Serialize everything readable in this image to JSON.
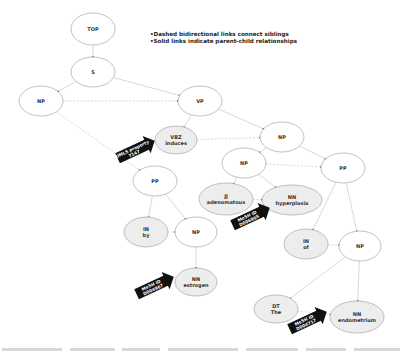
{
  "legend": {
    "line1": "•Dashed bidirectional links connect siblings",
    "line2": "•Solid links indicate parent-child relationships"
  },
  "nodes": [
    {
      "id": "top",
      "tag": "TOP",
      "word": "",
      "cx": 93,
      "cy": 29,
      "rx": 22,
      "ry": 16,
      "shaded": false
    },
    {
      "id": "s",
      "tag": "S",
      "word": "",
      "cx": 93,
      "cy": 72,
      "rx": 22,
      "ry": 15,
      "shaded": false
    },
    {
      "id": "np1",
      "tag": "NP",
      "word": "",
      "cx": 41,
      "cy": 101,
      "rx": 22,
      "ry": 15,
      "shaded": false
    },
    {
      "id": "vp",
      "tag": "VP",
      "word": "",
      "cx": 200,
      "cy": 101,
      "rx": 22,
      "ry": 15,
      "shaded": false
    },
    {
      "id": "vbz",
      "tag": "VBZ",
      "word": "induces",
      "cx": 176,
      "cy": 140,
      "rx": 21,
      "ry": 14,
      "shaded": true
    },
    {
      "id": "np2",
      "tag": "NP",
      "word": "",
      "cx": 282,
      "cy": 137,
      "rx": 22,
      "ry": 15,
      "shaded": false
    },
    {
      "id": "pp1",
      "tag": "PP",
      "word": "",
      "cx": 155,
      "cy": 181,
      "rx": 22,
      "ry": 15,
      "shaded": false
    },
    {
      "id": "np3",
      "tag": "NP",
      "word": "",
      "cx": 244,
      "cy": 163,
      "rx": 22,
      "ry": 15,
      "shaded": false
    },
    {
      "id": "pp2",
      "tag": "PP",
      "word": "",
      "cx": 343,
      "cy": 168,
      "rx": 22,
      "ry": 15,
      "shaded": false
    },
    {
      "id": "jj",
      "tag": "JJ",
      "word": "adenomatous",
      "cx": 226,
      "cy": 199,
      "rx": 27,
      "ry": 16,
      "shaded": true
    },
    {
      "id": "nn1",
      "tag": "NN",
      "word": "hyperplasia",
      "cx": 292,
      "cy": 200,
      "rx": 30,
      "ry": 15,
      "shaded": true
    },
    {
      "id": "in1",
      "tag": "IN",
      "word": "by",
      "cx": 146,
      "cy": 232,
      "rx": 22,
      "ry": 15,
      "shaded": true
    },
    {
      "id": "np4",
      "tag": "NP",
      "word": "",
      "cx": 196,
      "cy": 232,
      "rx": 21,
      "ry": 15,
      "shaded": false
    },
    {
      "id": "in2",
      "tag": "IN",
      "word": "of",
      "cx": 306,
      "cy": 244,
      "rx": 22,
      "ry": 15,
      "shaded": true
    },
    {
      "id": "np5",
      "tag": "NP",
      "word": "",
      "cx": 360,
      "cy": 246,
      "rx": 21,
      "ry": 15,
      "shaded": false
    },
    {
      "id": "nn2",
      "tag": "NN",
      "word": "estrogen",
      "cx": 196,
      "cy": 282,
      "rx": 21,
      "ry": 14,
      "shaded": true
    },
    {
      "id": "dt",
      "tag": "DT",
      "word": "The",
      "cx": 276,
      "cy": 309,
      "rx": 22,
      "ry": 14,
      "shaded": true
    },
    {
      "id": "nn3",
      "tag": "NN",
      "word": "endometrium",
      "cx": 357,
      "cy": 317,
      "rx": 27,
      "ry": 16,
      "shaded": true
    }
  ],
  "edges": [
    {
      "from": "top",
      "to": "s",
      "style": "solid"
    },
    {
      "from": "s",
      "to": "np1",
      "style": "solid"
    },
    {
      "from": "s",
      "to": "vp",
      "style": "solid"
    },
    {
      "from": "np1",
      "to": "vp",
      "style": "dashed"
    },
    {
      "from": "np1",
      "to": "pp1",
      "style": "dashed"
    },
    {
      "from": "vp",
      "to": "vbz",
      "style": "solid"
    },
    {
      "from": "vp",
      "to": "np2",
      "style": "solid"
    },
    {
      "from": "vbz",
      "to": "np2",
      "style": "dashed"
    },
    {
      "from": "np2",
      "to": "np3",
      "style": "solid"
    },
    {
      "from": "np2",
      "to": "pp2",
      "style": "solid"
    },
    {
      "from": "np3",
      "to": "pp2",
      "style": "dashed"
    },
    {
      "from": "np3",
      "to": "jj",
      "style": "solid"
    },
    {
      "from": "np3",
      "to": "nn1",
      "style": "solid"
    },
    {
      "from": "jj",
      "to": "nn1",
      "style": "dashed"
    },
    {
      "from": "pp1",
      "to": "in1",
      "style": "solid"
    },
    {
      "from": "pp1",
      "to": "np4",
      "style": "solid"
    },
    {
      "from": "in1",
      "to": "np4",
      "style": "dashed"
    },
    {
      "from": "np4",
      "to": "nn2",
      "style": "solid"
    },
    {
      "from": "pp2",
      "to": "in2",
      "style": "solid"
    },
    {
      "from": "pp2",
      "to": "np5",
      "style": "solid"
    },
    {
      "from": "in2",
      "to": "np5",
      "style": "dashed"
    },
    {
      "from": "np5",
      "to": "dt",
      "style": "solid"
    },
    {
      "from": "np5",
      "to": "nn3",
      "style": "solid"
    },
    {
      "from": "dt",
      "to": "nn3",
      "style": "dashed"
    }
  ],
  "callouts": [
    {
      "id": "umls",
      "line1": "UMLS property",
      "line2": "T147",
      "target": "vbz",
      "x": 133,
      "y": 151
    },
    {
      "id": "mesh-hyperplasia",
      "line1": "MeSH ID",
      "line2": "D006965",
      "target": "nn1",
      "x": 248,
      "y": 218
    },
    {
      "id": "mesh-estrogen",
      "line1": "MeSH ID",
      "line2": "D004967",
      "target": "nn2",
      "x": 152,
      "y": 287
    },
    {
      "id": "mesh-endometrium",
      "line1": "MeSH ID",
      "line2": "D004717",
      "target": "nn3",
      "x": 305,
      "y": 322
    }
  ],
  "colors": {
    "node_stroke": "#b0b0b0",
    "node_fill": "#ffffff",
    "node_fill_shaded": "#ededed",
    "edge": "#cfcfcf",
    "callout": "#111111",
    "text": "#333333"
  }
}
